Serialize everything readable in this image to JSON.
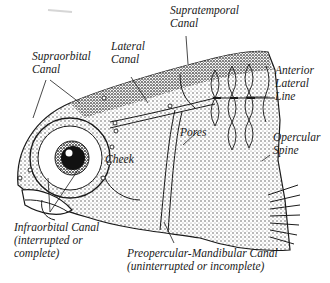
{
  "diagram": {
    "labels": {
      "supratemporal": {
        "line1": "Supratemporal",
        "line2": "Canal"
      },
      "lateral": {
        "line1": "Lateral",
        "line2": "Canal"
      },
      "supraorbital": {
        "line1": "Supraorbital",
        "line2": "Canal"
      },
      "anterior_lateral_line": {
        "line1": "Anterior",
        "line2": "Lateral",
        "line3": "Line"
      },
      "pores": "Pores",
      "opercular_spine": {
        "line1": "Opercular",
        "line2": "Spine"
      },
      "cheek": "Cheek",
      "infraorbital": {
        "line1": "Infraorbital Canal",
        "line2": "(interrupted or",
        "line3": "complete)"
      },
      "preopercular_mandibular": {
        "line1": "Preopercular-Mandibular Canal",
        "line2": "(uninterrupted or incomplete)"
      }
    },
    "colors": {
      "ink": "#1a1a1a",
      "background": "#ffffff",
      "shade": "#8a8a8a"
    }
  }
}
